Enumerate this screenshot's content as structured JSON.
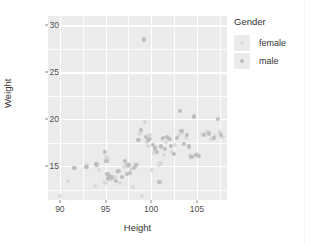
{
  "chart_data": {
    "type": "scatter",
    "title": "",
    "xlabel": "Height",
    "ylabel": "Weight",
    "xlim": [
      88.7,
      108.3
    ],
    "ylim": [
      11.4,
      31.0
    ],
    "xticks": [
      90,
      95,
      100,
      105
    ],
    "yticks": [
      15,
      20,
      25,
      30
    ],
    "xminor": [
      92.5,
      97.5,
      102.5,
      107.5
    ],
    "yminor": [
      12.5,
      17.5,
      22.5,
      27.5
    ],
    "grid": true,
    "legend": {
      "title": "Gender",
      "position": "right",
      "entries": [
        {
          "label": "female",
          "color": "#d9d9d9"
        },
        {
          "label": "male",
          "color": "#bdbdbd"
        }
      ]
    },
    "series": [
      {
        "name": "female",
        "color": "#d9d9d9",
        "points": [
          [
            90.0,
            11.8
          ],
          [
            90.9,
            13.4
          ],
          [
            93.0,
            15.1
          ],
          [
            93.8,
            12.9
          ],
          [
            94.3,
            14.6
          ],
          [
            94.8,
            13.3
          ],
          [
            95.0,
            13.2
          ],
          [
            95.1,
            16.0
          ],
          [
            95.2,
            15.8
          ],
          [
            95.4,
            13.9
          ],
          [
            95.6,
            13.6
          ],
          [
            96.0,
            13.8
          ],
          [
            96.3,
            14.4
          ],
          [
            96.6,
            13.2
          ],
          [
            97.0,
            14.9
          ],
          [
            97.2,
            15.3
          ],
          [
            97.4,
            15.0
          ],
          [
            97.6,
            15.2
          ],
          [
            97.8,
            14.7
          ],
          [
            98.0,
            12.8
          ],
          [
            98.2,
            14.9
          ],
          [
            98.4,
            15.2
          ],
          [
            98.8,
            18.5
          ],
          [
            99.0,
            11.8
          ],
          [
            99.3,
            19.7
          ],
          [
            99.5,
            17.6
          ],
          [
            99.6,
            17.2
          ],
          [
            99.8,
            18.3
          ],
          [
            100.1,
            14.6
          ],
          [
            100.3,
            16.4
          ],
          [
            100.5,
            17.0
          ],
          [
            100.8,
            15.1
          ],
          [
            101.0,
            15.3
          ],
          [
            101.2,
            17.9
          ],
          [
            101.4,
            16.2
          ],
          [
            101.6,
            17.6
          ],
          [
            101.8,
            18.1
          ],
          [
            102.3,
            16.5
          ],
          [
            102.6,
            17.3
          ],
          [
            103.0,
            18.3
          ],
          [
            103.4,
            18.6
          ],
          [
            103.8,
            18.0
          ],
          [
            104.2,
            16.2
          ],
          [
            104.6,
            16.1
          ],
          [
            105.0,
            16.3
          ],
          [
            105.6,
            18.4
          ],
          [
            106.1,
            18.6
          ],
          [
            106.6,
            17.9
          ],
          [
            107.0,
            18.2
          ],
          [
            107.5,
            18.6
          ],
          [
            107.8,
            18.1
          ]
        ]
      },
      {
        "name": "male",
        "color": "#bdbdbd",
        "points": [
          [
            91.6,
            14.8
          ],
          [
            92.9,
            14.9
          ],
          [
            94.0,
            15.2
          ],
          [
            94.9,
            16.5
          ],
          [
            95.1,
            15.6
          ],
          [
            95.2,
            14.2
          ],
          [
            95.3,
            13.7
          ],
          [
            95.5,
            14.0
          ],
          [
            95.7,
            13.8
          ],
          [
            96.1,
            13.4
          ],
          [
            96.4,
            14.5
          ],
          [
            96.8,
            13.9
          ],
          [
            97.1,
            15.6
          ],
          [
            97.3,
            14.2
          ],
          [
            97.5,
            15.1
          ],
          [
            97.7,
            14.3
          ],
          [
            98.1,
            14.8
          ],
          [
            98.3,
            15.1
          ],
          [
            98.6,
            17.8
          ],
          [
            98.9,
            18.9
          ],
          [
            99.2,
            28.5
          ],
          [
            99.4,
            18.1
          ],
          [
            99.7,
            17.8
          ],
          [
            99.9,
            17.9
          ],
          [
            100.2,
            17.3
          ],
          [
            100.4,
            16.9
          ],
          [
            100.6,
            16.5
          ],
          [
            100.9,
            13.3
          ],
          [
            101.1,
            17.1
          ],
          [
            101.3,
            18.0
          ],
          [
            101.5,
            16.8
          ],
          [
            101.7,
            18.1
          ],
          [
            102.0,
            17.9
          ],
          [
            102.2,
            17.2
          ],
          [
            102.5,
            16.3
          ],
          [
            102.8,
            18.0
          ],
          [
            103.1,
            20.9
          ],
          [
            103.3,
            18.8
          ],
          [
            103.6,
            17.4
          ],
          [
            103.9,
            18.3
          ],
          [
            104.1,
            17.1
          ],
          [
            104.4,
            16.0
          ],
          [
            104.7,
            20.3
          ],
          [
            104.9,
            16.2
          ],
          [
            105.2,
            16.1
          ],
          [
            105.8,
            18.3
          ],
          [
            106.3,
            18.5
          ],
          [
            106.9,
            18.0
          ],
          [
            107.3,
            20.0
          ],
          [
            107.6,
            18.3
          ]
        ]
      }
    ]
  },
  "panel": {
    "background": "#ebebeb",
    "gridline_color": "#ffffff"
  }
}
